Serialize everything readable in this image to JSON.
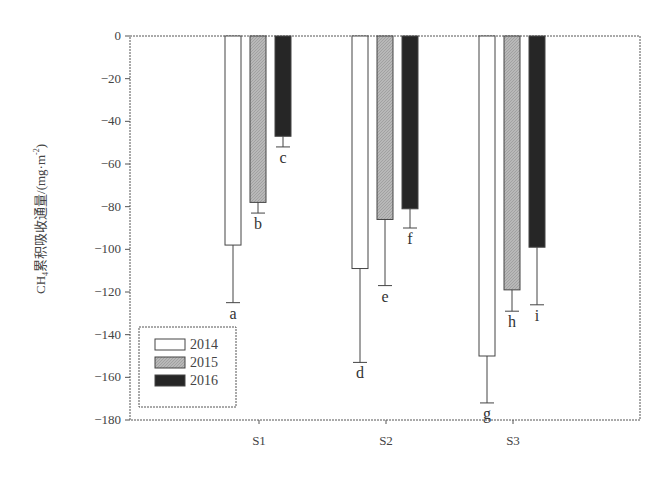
{
  "chart_data": {
    "type": "bar",
    "title": "",
    "xlabel": "",
    "ylabel": "CH4累积吸收通量/(mg·m-2)",
    "ylabel_parts": {
      "pre": "CH",
      "sub": "4",
      "mid": "累积吸收通量/(mg·m",
      "sup": "-2",
      "post": ")"
    },
    "ylim": [
      -180,
      0
    ],
    "yticks": [
      0,
      -20,
      -40,
      -60,
      -80,
      -100,
      -120,
      -140,
      -160,
      -180
    ],
    "categories": [
      "S1",
      "S2",
      "S3"
    ],
    "series": [
      {
        "name": "2014",
        "fill": "#ffffff",
        "values": [
          -98,
          -109,
          -150
        ],
        "error_to": [
          -125,
          -153,
          -172
        ],
        "letters": [
          "a",
          "d",
          "g"
        ]
      },
      {
        "name": "2015",
        "fill": "#b8b8b8",
        "values": [
          -78,
          -86,
          -119
        ],
        "error_to": [
          -83,
          -117,
          -129
        ],
        "letters": [
          "b",
          "e",
          "h"
        ]
      },
      {
        "name": "2016",
        "fill": "#262626",
        "values": [
          -47,
          -81,
          -99
        ],
        "error_to": [
          -52,
          -90,
          -126
        ],
        "letters": [
          "c",
          "f",
          "i"
        ]
      }
    ],
    "grid": false,
    "legend_position": "lower-left"
  }
}
